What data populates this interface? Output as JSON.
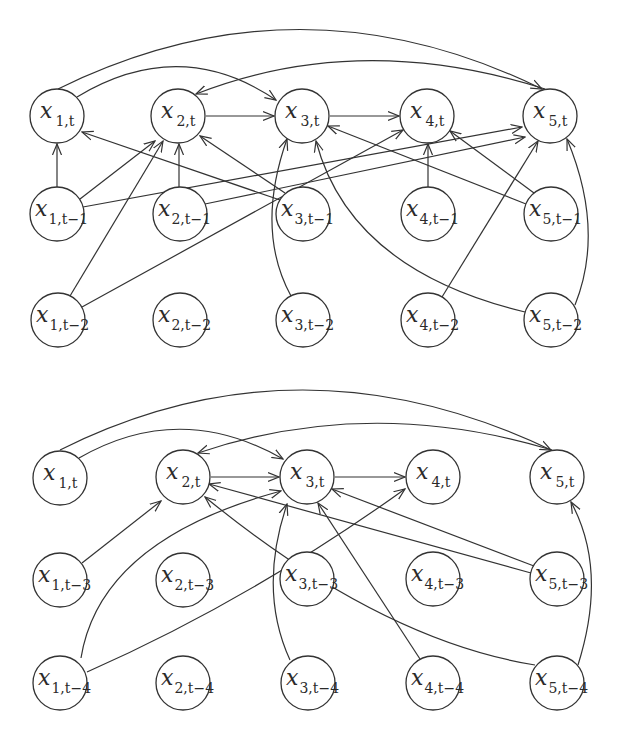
{
  "style": {
    "stroke_color": "#333333",
    "background": "#ffffff",
    "node_fill": "#ffffff"
  },
  "graphs": [
    {
      "id": "lags-1-2",
      "node_radius": 27,
      "nodes": [
        {
          "id": "x1t",
          "var": "x",
          "sub": "1,t",
          "x": 57,
          "y": 116
        },
        {
          "id": "x2t",
          "var": "x",
          "sub": "2,t",
          "x": 178,
          "y": 116
        },
        {
          "id": "x3t",
          "var": "x",
          "sub": "3,t",
          "x": 302,
          "y": 116
        },
        {
          "id": "x4t",
          "var": "x",
          "sub": "4,t",
          "x": 427,
          "y": 116
        },
        {
          "id": "x5t",
          "var": "x",
          "sub": "5,t",
          "x": 550,
          "y": 116
        },
        {
          "id": "x1t1",
          "var": "x",
          "sub": "1,t−1",
          "x": 57,
          "y": 214
        },
        {
          "id": "x2t1",
          "var": "x",
          "sub": "2,t−1",
          "x": 180,
          "y": 214
        },
        {
          "id": "x3t1",
          "var": "x",
          "sub": "3,t−1",
          "x": 303,
          "y": 214
        },
        {
          "id": "x4t1",
          "var": "x",
          "sub": "4,t−1",
          "x": 428,
          "y": 214
        },
        {
          "id": "x5t1",
          "var": "x",
          "sub": "5,t−1",
          "x": 551,
          "y": 214
        },
        {
          "id": "x1t2",
          "var": "x",
          "sub": "1,t−2",
          "x": 58,
          "y": 320
        },
        {
          "id": "x2t2",
          "var": "x",
          "sub": "2,t−2",
          "x": 180,
          "y": 320
        },
        {
          "id": "x3t2",
          "var": "x",
          "sub": "3,t−2",
          "x": 303,
          "y": 320
        },
        {
          "id": "x4t2",
          "var": "x",
          "sub": "4,t−2",
          "x": 428,
          "y": 320
        },
        {
          "id": "x5t2",
          "var": "x",
          "sub": "5,t−2",
          "x": 551,
          "y": 320
        }
      ],
      "edges": [
        {
          "from": "x1t",
          "to": "x3t",
          "d": "M 77 97 Q 180 35 276 100"
        },
        {
          "from": "x1t",
          "to": "x5t",
          "d": "M 58 89 Q 300 -30 542 89"
        },
        {
          "from": "x5t",
          "to": "x2t",
          "d": "M 545 89 Q 360 30 196 94"
        },
        {
          "from": "x2t",
          "to": "x3t",
          "d": "M 206 116 L 274 116"
        },
        {
          "from": "x3t",
          "to": "x4t",
          "d": "M 330 116 L 399 116"
        },
        {
          "from": "x1t1",
          "to": "x1t",
          "d": "M 57 187 L 57 144"
        },
        {
          "from": "x1t1",
          "to": "x2t",
          "d": "M 80 199 L 155 141"
        },
        {
          "from": "x1t1",
          "to": "x5t",
          "d": "M 83 207 L 522 127"
        },
        {
          "from": "x2t1",
          "to": "x2t",
          "d": "M 179 187 L 179 144"
        },
        {
          "from": "x2t1",
          "to": "x5t",
          "d": "M 205 204 L 525 137"
        },
        {
          "from": "x3t1",
          "to": "x1t",
          "d": "M 280 200 L 82 132"
        },
        {
          "from": "x3t1",
          "to": "x2t",
          "d": "M 285 193 L 200 136"
        },
        {
          "from": "x1t2",
          "to": "x2t",
          "d": "M 70 296 L 163 141"
        },
        {
          "from": "x1t2",
          "to": "x4t",
          "d": "M 82 307 L 403 130"
        },
        {
          "from": "x3t2",
          "to": "x3t",
          "d": "M 291 296 Q 255 230 287 139"
        },
        {
          "from": "x4t1",
          "to": "x4t",
          "d": "M 428 187 L 428 144"
        },
        {
          "from": "x5t1",
          "to": "x4t",
          "d": "M 534 193 L 450 131"
        },
        {
          "from": "x5t1",
          "to": "x3t",
          "d": "M 526 204 L 328 126"
        },
        {
          "from": "x4t2",
          "to": "x5t",
          "d": "M 442 297 L 538 141"
        },
        {
          "from": "x5t2",
          "to": "x3t",
          "d": "M 525 312 Q 350 270 316 141"
        },
        {
          "from": "x5t2",
          "to": "x5t",
          "d": "M 575 305 Q 605 230 567 139"
        }
      ]
    },
    {
      "id": "lags-3-4",
      "node_radius": 27,
      "nodes": [
        {
          "id": "x1t",
          "var": "x",
          "sub": "1,t",
          "x": 60,
          "y": 478
        },
        {
          "id": "x2t",
          "var": "x",
          "sub": "2,t",
          "x": 183,
          "y": 477
        },
        {
          "id": "x3t",
          "var": "x",
          "sub": "3,t",
          "x": 307,
          "y": 477
        },
        {
          "id": "x4t",
          "var": "x",
          "sub": "4,t",
          "x": 433,
          "y": 477
        },
        {
          "id": "x5t",
          "var": "x",
          "sub": "5,t",
          "x": 557,
          "y": 477
        },
        {
          "id": "x1t3",
          "var": "x",
          "sub": "1,t−3",
          "x": 60,
          "y": 580
        },
        {
          "id": "x2t3",
          "var": "x",
          "sub": "2,t−3",
          "x": 183,
          "y": 580
        },
        {
          "id": "x3t3",
          "var": "x",
          "sub": "3,t−3",
          "x": 307,
          "y": 579
        },
        {
          "id": "x4t3",
          "var": "x",
          "sub": "4,t−3",
          "x": 433,
          "y": 579
        },
        {
          "id": "x5t3",
          "var": "x",
          "sub": "5,t−3",
          "x": 557,
          "y": 579
        },
        {
          "id": "x1t4",
          "var": "x",
          "sub": "1,t−4",
          "x": 60,
          "y": 683
        },
        {
          "id": "x2t4",
          "var": "x",
          "sub": "2,t−4",
          "x": 183,
          "y": 683
        },
        {
          "id": "x3t4",
          "var": "x",
          "sub": "3,t−4",
          "x": 308,
          "y": 683
        },
        {
          "id": "x4t4",
          "var": "x",
          "sub": "4,t−4",
          "x": 433,
          "y": 683
        },
        {
          "id": "x5t4",
          "var": "x",
          "sub": "5,t−4",
          "x": 557,
          "y": 683
        }
      ],
      "edges": [
        {
          "from": "x1t",
          "to": "x3t",
          "d": "M 79 458 Q 180 400 283 459"
        },
        {
          "from": "x1t",
          "to": "x5t",
          "d": "M 60 450 Q 300 330 551 450"
        },
        {
          "from": "x5t",
          "to": "x2t",
          "d": "M 552 450 Q 370 395 198 453"
        },
        {
          "from": "x2t",
          "to": "x3t",
          "d": "M 211 477 L 279 477"
        },
        {
          "from": "x3t",
          "to": "x4t",
          "d": "M 335 477 L 405 477"
        },
        {
          "from": "x1t3",
          "to": "x2t",
          "d": "M 82 563 L 161 501"
        },
        {
          "from": "x1t4",
          "to": "x3t",
          "d": "M 81 658 Q 100 540 281 491"
        },
        {
          "from": "x1t4",
          "to": "x4t",
          "d": "M 87 672 Q 250 600 405 489"
        },
        {
          "from": "x3t4",
          "to": "x3t",
          "d": "M 290 660 Q 258 590 287 504"
        },
        {
          "from": "x4t4",
          "to": "x3t",
          "d": "M 420 659 L 318 503"
        },
        {
          "from": "x5t3",
          "to": "x3t",
          "d": "M 534 566 L 332 489"
        },
        {
          "from": "x5t3",
          "to": "x2t",
          "d": "M 531 573 L 209 484"
        },
        {
          "from": "x5t4",
          "to": "x2t",
          "d": "M 535 665 Q 380 640 205 497"
        },
        {
          "from": "x5t4",
          "to": "x5t",
          "d": "M 578 665 Q 608 570 571 502"
        }
      ]
    }
  ]
}
